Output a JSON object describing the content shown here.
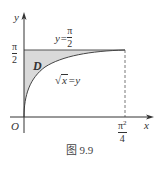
{
  "figure": {
    "caption": "图 9.9",
    "axes": {
      "x_label": "x",
      "y_label": "y",
      "origin_label": "O"
    },
    "y_tick": {
      "numerator": "π",
      "denominator": "2"
    },
    "x_tick": {
      "numerator": "π²",
      "denominator": "4",
      "num_base": "π",
      "num_sup": "2"
    },
    "horizontal_line_label": {
      "lhs": "y=",
      "numerator": "π",
      "denominator": "2"
    },
    "curve_label": {
      "sqrt_arg": "x",
      "rest": "=y"
    },
    "region_label": "D",
    "colors": {
      "region_fill": "#d9d9d9",
      "lines": "#444444"
    }
  }
}
